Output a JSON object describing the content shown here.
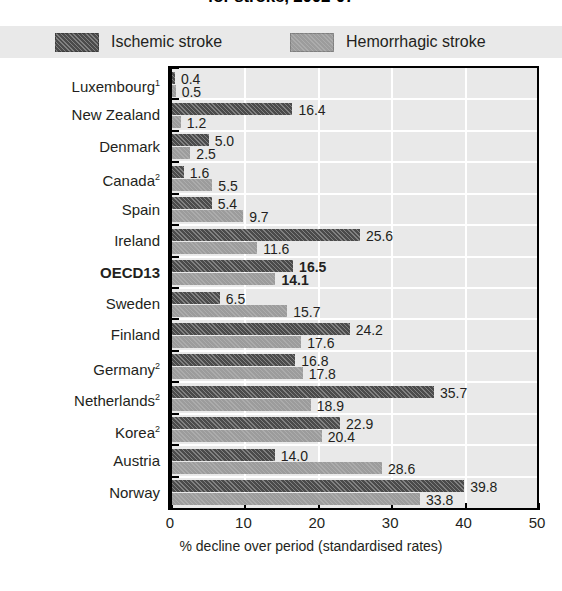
{
  "title": "for stroke, 2002-07",
  "legend": {
    "items": [
      {
        "label": "Ischemic stroke",
        "color": "#4b4b4b",
        "swatch": "dark-hatched-swatch"
      },
      {
        "label": "Hemorrhagic stroke",
        "color": "#9c9c9c",
        "swatch": "light-gray-swatch"
      }
    ]
  },
  "axis": {
    "x_title": "% decline over period (standardised rates)",
    "x_ticks": [
      "0",
      "10",
      "20",
      "30",
      "40",
      "50"
    ]
  },
  "chart_data": {
    "type": "bar",
    "orientation": "horizontal",
    "title": "for stroke, 2002-07",
    "xlabel": "% decline over period (standardised rates)",
    "ylabel": "",
    "xlim": [
      0,
      50
    ],
    "xticks": [
      0,
      10,
      20,
      30,
      40,
      50
    ],
    "grid": true,
    "legend_position": "top",
    "categories": [
      "Luxembourg¹",
      "New Zealand",
      "Denmark",
      "Canada²",
      "Spain",
      "Ireland",
      "OECD13",
      "Sweden",
      "Finland",
      "Germany²",
      "Netherlands²",
      "Korea²",
      "Austria",
      "Norway"
    ],
    "series": [
      {
        "name": "Ischemic stroke",
        "color": "#4b4b4b",
        "values": [
          0.4,
          16.4,
          5.0,
          1.6,
          5.4,
          25.6,
          16.5,
          6.5,
          24.2,
          16.8,
          35.7,
          22.9,
          14.0,
          39.8
        ]
      },
      {
        "name": "Hemorrhagic stroke",
        "color": "#9c9c9c",
        "values": [
          0.5,
          1.2,
          2.5,
          5.5,
          9.7,
          11.6,
          14.1,
          15.7,
          17.6,
          17.8,
          18.9,
          20.4,
          28.6,
          33.8
        ]
      }
    ],
    "highlight_category": "OECD13"
  },
  "rows": [
    {
      "label": "Luxembourg",
      "sup": "1",
      "bold": false,
      "ischemic": "0.4",
      "hemorrhagic": "0.5"
    },
    {
      "label": "New Zealand",
      "sup": "",
      "bold": false,
      "ischemic": "16.4",
      "hemorrhagic": "1.2"
    },
    {
      "label": "Denmark",
      "sup": "",
      "bold": false,
      "ischemic": "5.0",
      "hemorrhagic": "2.5"
    },
    {
      "label": "Canada",
      "sup": "2",
      "bold": false,
      "ischemic": "1.6",
      "hemorrhagic": "5.5"
    },
    {
      "label": "Spain",
      "sup": "",
      "bold": false,
      "ischemic": "5.4",
      "hemorrhagic": "9.7"
    },
    {
      "label": "Ireland",
      "sup": "",
      "bold": false,
      "ischemic": "25.6",
      "hemorrhagic": "11.6"
    },
    {
      "label": "OECD13",
      "sup": "",
      "bold": true,
      "ischemic": "16.5",
      "hemorrhagic": "14.1"
    },
    {
      "label": "Sweden",
      "sup": "",
      "bold": false,
      "ischemic": "6.5",
      "hemorrhagic": "15.7"
    },
    {
      "label": "Finland",
      "sup": "",
      "bold": false,
      "ischemic": "24.2",
      "hemorrhagic": "17.6"
    },
    {
      "label": "Germany",
      "sup": "2",
      "bold": false,
      "ischemic": "16.8",
      "hemorrhagic": "17.8"
    },
    {
      "label": "Netherlands",
      "sup": "2",
      "bold": false,
      "ischemic": "35.7",
      "hemorrhagic": "18.9"
    },
    {
      "label": "Korea",
      "sup": "2",
      "bold": false,
      "ischemic": "22.9",
      "hemorrhagic": "20.4"
    },
    {
      "label": "Austria",
      "sup": "",
      "bold": false,
      "ischemic": "14.0",
      "hemorrhagic": "28.6"
    },
    {
      "label": "Norway",
      "sup": "",
      "bold": false,
      "ischemic": "39.8",
      "hemorrhagic": "33.8"
    }
  ]
}
